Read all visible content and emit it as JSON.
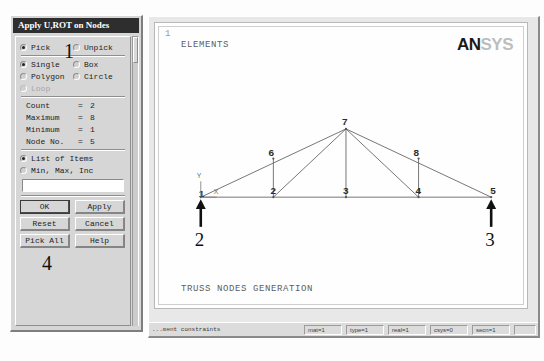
{
  "dialog": {
    "title": "Apply U,ROT on Nodes",
    "mode_group": [
      {
        "label": "Pick",
        "selected": true,
        "disabled": false
      },
      {
        "label": "Unpick",
        "selected": false,
        "disabled": false
      }
    ],
    "shape_group": [
      {
        "label": "Single",
        "selected": true,
        "disabled": false
      },
      {
        "label": "Box",
        "selected": false,
        "disabled": false
      },
      {
        "label": "Polygon",
        "selected": false,
        "disabled": false
      },
      {
        "label": "Circle",
        "selected": false,
        "disabled": false
      },
      {
        "label": "Loop",
        "selected": false,
        "disabled": true
      }
    ],
    "info": [
      {
        "label": "Count",
        "eq": "=",
        "value": "2"
      },
      {
        "label": "Maximum",
        "eq": "=",
        "value": "8"
      },
      {
        "label": "Minimum",
        "eq": "=",
        "value": "1"
      },
      {
        "label": "Node No.",
        "eq": "=",
        "value": "5"
      }
    ],
    "list_group": [
      {
        "label": "List of Items",
        "selected": true,
        "disabled": false
      },
      {
        "label": "Min, Max, Inc",
        "selected": false,
        "disabled": false
      }
    ],
    "input": {
      "value": "",
      "placeholder": ""
    },
    "buttons": [
      {
        "label": "OK",
        "default": true
      },
      {
        "label": "Apply",
        "default": false
      },
      {
        "label": "Reset",
        "default": false
      },
      {
        "label": "Cancel",
        "default": false
      },
      {
        "label": "Pick All",
        "default": false
      },
      {
        "label": "Help",
        "default": false
      }
    ]
  },
  "graphics": {
    "view_number": "1",
    "elements_label": "ELEMENTS",
    "caption": "TRUSS NODES GENERATION",
    "logo": {
      "dark": "AN",
      "light": "SYS"
    },
    "axis_triad": {
      "y": "Y",
      "x": "X"
    }
  },
  "model": {
    "nodes": [
      {
        "id": "1",
        "x": 42,
        "y": 172,
        "lx": 40,
        "ly": 172
      },
      {
        "id": "2",
        "x": 115,
        "y": 172,
        "lx": 112,
        "ly": 169
      },
      {
        "id": "3",
        "x": 188,
        "y": 172,
        "lx": 185,
        "ly": 169
      },
      {
        "id": "4",
        "x": 261,
        "y": 172,
        "lx": 258,
        "ly": 169
      },
      {
        "id": "5",
        "x": 334,
        "y": 172,
        "lx": 333,
        "ly": 169
      },
      {
        "id": "6",
        "x": 115,
        "y": 133,
        "lx": 110,
        "ly": 130
      },
      {
        "id": "7",
        "x": 188,
        "y": 103,
        "lx": 184,
        "ly": 99
      },
      {
        "id": "8",
        "x": 261,
        "y": 133,
        "lx": 256,
        "ly": 130
      }
    ],
    "elements": [
      {
        "from": "1",
        "to": "2"
      },
      {
        "from": "2",
        "to": "3"
      },
      {
        "from": "3",
        "to": "4"
      },
      {
        "from": "4",
        "to": "5"
      },
      {
        "from": "1",
        "to": "7"
      },
      {
        "from": "7",
        "to": "5"
      },
      {
        "from": "2",
        "to": "6"
      },
      {
        "from": "2",
        "to": "7"
      },
      {
        "from": "3",
        "to": "7"
      },
      {
        "from": "4",
        "to": "7"
      },
      {
        "from": "4",
        "to": "8"
      }
    ],
    "loads": [
      {
        "node": "1",
        "x": 42,
        "y": 172,
        "direction": "up",
        "annotation": "2"
      },
      {
        "node": "5",
        "x": 334,
        "y": 172,
        "direction": "up",
        "annotation": "3"
      }
    ]
  },
  "annotations": [
    {
      "id": "ann-1",
      "text": "1",
      "left": 64,
      "top": 41
    },
    {
      "id": "ann-4",
      "text": "4",
      "left": 42,
      "top": 253
    }
  ],
  "statusbar": {
    "message": "...ment constraints",
    "cells": [
      {
        "text": "mat=1"
      },
      {
        "text": "type=1"
      },
      {
        "text": "real=1"
      },
      {
        "text": "csys=0"
      },
      {
        "text": "secn=1"
      },
      {
        "text": ""
      }
    ]
  }
}
